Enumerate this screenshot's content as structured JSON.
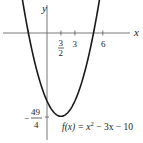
{
  "chart_data": {
    "type": "line",
    "title": "",
    "function_label": "f(x) = x² − 3x − 10",
    "function_label_parts": {
      "lhs": "f(x) = x",
      "exp": "2",
      "rhs": " − 3x − 10"
    },
    "xlabel": "x",
    "ylabel": "y",
    "x_ticks": [
      -2,
      1.5,
      3,
      5,
      6
    ],
    "x_tick_labels": [
      {
        "value": 1.5,
        "num": "3",
        "den": "2"
      },
      {
        "value": 3,
        "text": "3"
      },
      {
        "value": 6,
        "text": "6"
      }
    ],
    "y_tick_labels": [
      {
        "value": -12.25,
        "sign": "−",
        "num": "49",
        "den": "4"
      }
    ],
    "vertex": {
      "x": 1.5,
      "y": -12.25
    },
    "roots": [
      -2,
      5
    ],
    "series": [
      {
        "name": "f(x) = x^2 - 3x - 10",
        "x": [
          -3.5,
          -3,
          -2,
          -1,
          0,
          1,
          1.5,
          2,
          3,
          4,
          5,
          6,
          6.5
        ],
        "values": [
          12.75,
          8,
          0,
          -6,
          -10,
          -12,
          -12.25,
          -12,
          -10,
          -6,
          0,
          8,
          12.75
        ]
      }
    ],
    "xlim": [
      -5,
      8.5
    ],
    "ylim": [
      -14,
      3.5
    ],
    "grid": false,
    "legend": null
  }
}
